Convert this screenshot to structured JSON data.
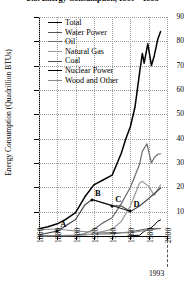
{
  "chart_data": {
    "type": "line",
    "title": "U.S. Energy Consumption, 1860 – 1993",
    "xlabel": "",
    "ylabel": "Energy Consumption (Quadrillion BTUs)",
    "xlim": [
      1860,
      2000
    ],
    "ylim": [
      0,
      90
    ],
    "grid": true,
    "legend_position": "top-left",
    "yticks": [
      10,
      20,
      30,
      40,
      50,
      60,
      70,
      80,
      90
    ],
    "xticks": [
      1860,
      1880,
      1900,
      1920,
      1940,
      1960,
      1980,
      2000
    ],
    "end_year_note": "1993",
    "series": [
      {
        "name": "Total",
        "color": "#000000",
        "width": 1.5,
        "x": [
          1860,
          1870,
          1880,
          1890,
          1900,
          1910,
          1920,
          1930,
          1940,
          1950,
          1955,
          1960,
          1965,
          1970,
          1973,
          1975,
          1979,
          1983,
          1986,
          1990,
          1993
        ],
        "values": [
          3.0,
          3.8,
          5.0,
          7.0,
          9.6,
          16.0,
          21.0,
          23.0,
          25.0,
          34.0,
          40.0,
          45.0,
          53.0,
          67.0,
          75.0,
          71.0,
          79.0,
          70.0,
          74.0,
          81.0,
          84.0
        ]
      },
      {
        "name": "Water Power",
        "color": "#555555",
        "width": 1.0,
        "x": [
          1860,
          1900,
          1920,
          1940,
          1960,
          1980,
          1993
        ],
        "values": [
          0.1,
          0.3,
          0.8,
          0.9,
          1.7,
          3.1,
          3.1
        ]
      },
      {
        "name": "Oil",
        "color": "#6b6b6b",
        "width": 1.2,
        "x": [
          1860,
          1900,
          1910,
          1920,
          1930,
          1940,
          1950,
          1960,
          1970,
          1973,
          1978,
          1983,
          1986,
          1990,
          1993
        ],
        "values": [
          0.0,
          0.2,
          1.0,
          2.7,
          5.4,
          7.5,
          13.3,
          20.0,
          29.5,
          34.8,
          37.9,
          30.0,
          32.2,
          33.6,
          33.8
        ]
      },
      {
        "name": "Natural Gas",
        "color": "#9a9a9a",
        "width": 1.2,
        "x": [
          1860,
          1900,
          1920,
          1930,
          1940,
          1950,
          1960,
          1970,
          1973,
          1980,
          1986,
          1993
        ],
        "values": [
          0.0,
          0.1,
          0.8,
          1.9,
          2.7,
          6.0,
          12.4,
          21.8,
          22.5,
          20.4,
          16.7,
          21.0
        ]
      },
      {
        "name": "Coal",
        "color": "#4a4a4a",
        "width": 1.2,
        "x": [
          1860,
          1880,
          1900,
          1910,
          1918,
          1930,
          1940,
          1950,
          1960,
          1970,
          1980,
          1993
        ],
        "values": [
          0.5,
          2.0,
          6.8,
          12.7,
          15.0,
          13.6,
          12.5,
          12.3,
          10.1,
          12.3,
          15.4,
          19.7
        ]
      },
      {
        "name": "Nuclear Power",
        "color": "#000000",
        "width": 1.0,
        "x": [
          1957,
          1965,
          1970,
          1975,
          1980,
          1985,
          1990,
          1993
        ],
        "values": [
          0.0,
          0.2,
          0.3,
          1.9,
          2.7,
          4.1,
          6.1,
          6.6
        ]
      },
      {
        "name": "Wood and Other",
        "color": "#8a8a8a",
        "width": 1.0,
        "x": [
          1860,
          1880,
          1900,
          1920,
          1940,
          1960,
          1980,
          1993
        ],
        "values": [
          2.6,
          2.9,
          2.0,
          1.6,
          1.4,
          1.3,
          2.5,
          3.0
        ]
      }
    ],
    "annotations": [
      {
        "label": "A",
        "x": 1880,
        "y": 2.0
      },
      {
        "label": "B",
        "x": 1918,
        "y": 15.0
      },
      {
        "label": "C",
        "x": 1940,
        "y": 12.5
      },
      {
        "label": "D",
        "x": 1960,
        "y": 10.1
      }
    ],
    "annotation_path": [
      "B",
      "C",
      "D"
    ]
  },
  "legend": {
    "items": [
      {
        "label": "Total"
      },
      {
        "label": "Water Power"
      },
      {
        "label": "Oil"
      },
      {
        "label": "Natural Gas"
      },
      {
        "label": "Coal"
      },
      {
        "label": "Nuclear Power"
      },
      {
        "label": "Wood and Other"
      }
    ]
  }
}
